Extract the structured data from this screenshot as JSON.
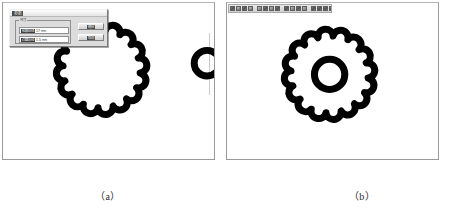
{
  "figure": {
    "captions": {
      "panel_a": "（a）",
      "panel_b": "（b）"
    }
  },
  "panel_a": {
    "dialog": {
      "title": "参数",
      "group_label": "尺寸",
      "fields": [
        {
          "label": "轮廓半径",
          "value": "17",
          "unit": "mm"
        },
        {
          "label": "凸圆半径",
          "value": "1.5",
          "unit": "mm"
        }
      ],
      "buttons": [
        {
          "label": "确定"
        },
        {
          "label": "取消"
        }
      ]
    },
    "shape": {
      "name": "scalloped-flower-outline",
      "lobes": 11,
      "stroke_color": "#000000"
    },
    "ring": {
      "name": "small-ring",
      "stroke_color": "#000000"
    }
  },
  "panel_b": {
    "toolbar": {
      "groups": [
        {
          "icons": [
            "new-icon",
            "open-icon",
            "save-icon",
            "print-icon"
          ]
        },
        {
          "icons": [
            "cut-icon",
            "copy-icon",
            "paste-icon",
            "undo-icon"
          ]
        },
        {
          "icons": [
            "zoom-in-icon",
            "zoom-out-icon",
            "pan-icon",
            "fit-icon"
          ]
        },
        {
          "icons": [
            "line-icon",
            "arc-icon",
            "circle-icon",
            "polygon-icon"
          ]
        },
        {
          "icons": [
            "dimension-icon"
          ]
        }
      ]
    },
    "shape": {
      "name": "scalloped-gear-outline",
      "lobes": 11,
      "stroke_color": "#000000"
    },
    "inner_ring": {
      "name": "inner-ring",
      "stroke_color": "#000000"
    }
  }
}
